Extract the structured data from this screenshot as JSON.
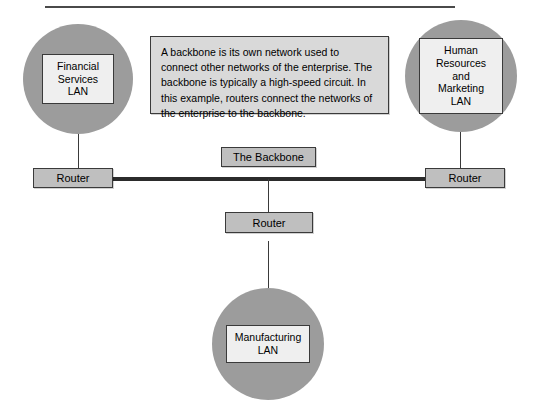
{
  "diagram": {
    "description_panel": {
      "text": "A backbone is its own network used to connect other networks of the enterprise. The backbone is typically a high-speed circuit. In this example, routers connect the networks of the enterprise to the backbone."
    },
    "nodes": [
      {
        "id": "financial-lan",
        "label": "Financial\nServices\nLAN",
        "label_lines": [
          "Financial",
          "Services",
          "LAN"
        ],
        "shape": "circle"
      },
      {
        "id": "hr-marketing-lan",
        "label": "Human\nResources and\nMarketing\nLAN",
        "label_lines": [
          "Human",
          "Resources and",
          "Marketing",
          "LAN"
        ],
        "shape": "circle"
      },
      {
        "id": "manufacturing-lan",
        "label": "Manufacturing\nLAN",
        "label_lines": [
          "Manufacturing",
          "LAN"
        ],
        "shape": "circle"
      }
    ],
    "routers": [
      {
        "id": "router-left",
        "label": "Router"
      },
      {
        "id": "router-right",
        "label": "Router"
      },
      {
        "id": "router-bottom",
        "label": "Router"
      }
    ],
    "backbone": {
      "label": "The Backbone"
    },
    "colors": {
      "circle_fill": "#9c9c9c",
      "lan_box_fill": "#efefef",
      "router_fill": "#bfbfbf",
      "panel_fill": "#d9d9d9",
      "line": "#2b2b2b",
      "border": "#3a3a3a",
      "background": "#ffffff"
    }
  }
}
